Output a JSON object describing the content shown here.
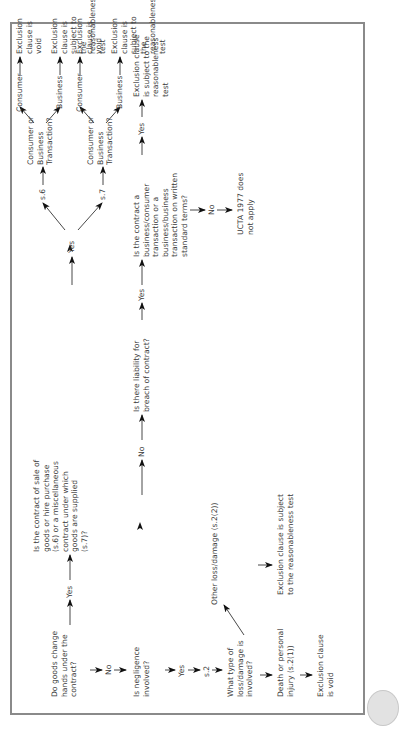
{
  "diagram": {
    "nodes": {
      "goods_change": "Do goods change\nhands under the\ncontract?",
      "yes_1": "Yes",
      "contract_type": "Is the contract of sale of\ngoods or hire purchase\n(s.6) or a miscellaneous\ncontract under which\ngoods are supplied\n(s.7)?",
      "yes_2": "Yes",
      "s6": "s.6",
      "s7": "s.7",
      "cbt_1": "Consumer or\nBusiness\nTransaction?",
      "cbt_2": "Consumer or\nBusiness\nTransaction?",
      "consumer_1": "Consumer",
      "business_1": "Business",
      "consumer_2": "Consumer",
      "business_2": "Business",
      "void_1": "Exclusion clause is void",
      "reason_1": "Exclusion clause is subject to\nthe reasonableness test",
      "void_2": "Exclusion clause is void",
      "reason_2": "Exclusion clause is subject to\nthe reasonableness test",
      "no_1": "No",
      "negligence": "Is negligence\ninvolved?",
      "no_2": "No",
      "breach": "Is there liability for\nbreach of contract?",
      "yes_3": "Yes",
      "written_terms": "Is the contract a\nbusiness/consumer\ntransaction or a\nbusiness/business\ntransaction on written\nstandard terms?",
      "yes_4": "Yes",
      "reason_3": "Exclusion clause\nis subject to the\nreasonableness\ntest",
      "no_3": "No",
      "ucta_not_apply": "UCTA 1977 does\nnot apply",
      "yes_5": "Yes",
      "s2": "s.2",
      "loss_type": "What type of\nloss/damage is\ninvolved?",
      "other_loss": "Other loss/damage (s.2(2))",
      "reason_4": "Exclusion clause is subject\nto the reasonableness test",
      "death_injury": "Death or personal\ninjury (s.2(1))",
      "void_3": "Exclusion clause\nis void"
    },
    "colors": {
      "text": "#3a3a3a",
      "frame": "#8a8a8a",
      "arrow": "#111111"
    }
  }
}
